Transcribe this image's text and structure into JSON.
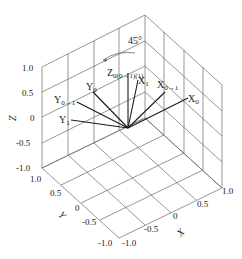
{
  "figure": {
    "type": "3d-coordinate-frame-diagram",
    "angle_annotation": "45°",
    "axes": {
      "x": {
        "label": "X",
        "ticks": [
          "-1.0",
          "-0.5",
          "0",
          "0.5",
          "1.0"
        ]
      },
      "y": {
        "label": "Y",
        "ticks": [
          "1.0",
          "0.5",
          "0",
          "-0.5",
          "-1.0"
        ]
      },
      "z": {
        "label": "Z",
        "ticks": [
          "1.0",
          "0.5",
          "0",
          "-0.5",
          "-1.0"
        ]
      }
    },
    "vectors": [
      {
        "id": "Z0",
        "main": "Z",
        "sub": "0(0→1)(1)"
      },
      {
        "id": "X1",
        "main": "X",
        "sub": "1"
      },
      {
        "id": "X0to1",
        "main": "X",
        "sub": "0→1"
      },
      {
        "id": "X0",
        "main": "X",
        "sub": "0"
      },
      {
        "id": "Y0",
        "main": "Y",
        "sub": "0"
      },
      {
        "id": "Y0to1",
        "main": "Y",
        "sub": "0→1"
      },
      {
        "id": "Y1",
        "main": "Y",
        "sub": "1"
      }
    ]
  }
}
